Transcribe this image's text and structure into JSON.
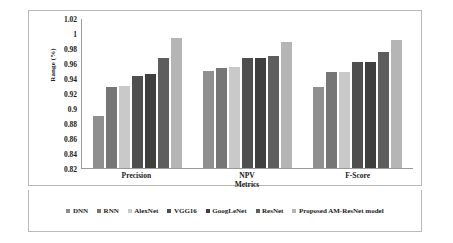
{
  "chart_data": {
    "type": "bar",
    "title": "",
    "xlabel": "Metrics",
    "ylabel": "Range (%)",
    "categories": [
      "Precision",
      "NPV",
      "F-Score"
    ],
    "ylim": [
      0.82,
      1.02
    ],
    "ytick_labels": [
      "1.02",
      "1",
      "0.98",
      "0.96",
      "0.94",
      "0.92",
      "0.9",
      "0.88",
      "0.86",
      "0.84",
      "0.82"
    ],
    "ytick_values": [
      1.02,
      1.0,
      0.98,
      0.96,
      0.94,
      0.92,
      0.9,
      0.88,
      0.86,
      0.84,
      0.82
    ],
    "grid": false,
    "legend_position": "bottom",
    "series": [
      {
        "name": "DNN",
        "color": "#8f8f8f",
        "values": [
          0.89,
          0.95,
          0.928
        ]
      },
      {
        "name": "RNN",
        "color": "#767676",
        "values": [
          0.928,
          0.953,
          0.948
        ]
      },
      {
        "name": "AlexNet",
        "color": "#c9c9c9",
        "values": [
          0.93,
          0.955,
          0.948
        ]
      },
      {
        "name": "VGG16",
        "color": "#4f4f4f",
        "values": [
          0.943,
          0.967,
          0.961
        ]
      },
      {
        "name": "GoogLeNet",
        "color": "#3f3f3f",
        "values": [
          0.946,
          0.967,
          0.962
        ]
      },
      {
        "name": "ResNet",
        "color": "#5e5e5e",
        "values": [
          0.967,
          0.969,
          0.975
        ]
      },
      {
        "name": "Proposed AM-ResNet model",
        "color": "#b5b5b5",
        "values": [
          0.994,
          0.988,
          0.991
        ]
      }
    ]
  }
}
